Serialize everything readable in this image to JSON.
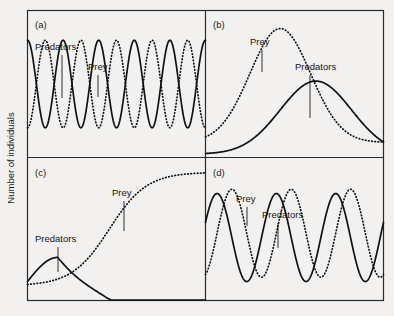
{
  "figure": {
    "axis": {
      "ylabel": "Number of individuals"
    },
    "panels": [
      {
        "letter": "(a)",
        "labels": [
          {
            "text": "Predators",
            "series": "predators"
          },
          {
            "text": "Prey",
            "series": "prey"
          }
        ]
      },
      {
        "letter": "(b)",
        "labels": [
          {
            "text": "Prey",
            "series": "prey"
          },
          {
            "text": "Predators",
            "series": "predators"
          }
        ]
      },
      {
        "letter": "(c)",
        "labels": [
          {
            "text": "Prey",
            "series": "prey"
          },
          {
            "text": "Predators",
            "series": "predators"
          }
        ]
      },
      {
        "letter": "(d)",
        "labels": [
          {
            "text": "Prey",
            "series": "prey"
          },
          {
            "text": "Predators",
            "series": "predators"
          }
        ]
      }
    ]
  },
  "chart_data": [
    {
      "id": "panel-a",
      "type": "line",
      "title": "(a)",
      "xlabel": "",
      "ylabel": "Number of individuals",
      "xlim": [
        0,
        1
      ],
      "ylim": [
        0,
        1
      ],
      "grid": false,
      "legend": "inline-labels",
      "description": "Sustained neutrally-stable oscillations; predators and prey cycle out of phase with constant amplitude.",
      "series": [
        {
          "name": "Predators",
          "style": "solid",
          "form": "cosine",
          "cycles": 5.0,
          "amplitude": 0.3,
          "baseline": 0.5,
          "phase": 0.0,
          "damping": 0.0
        },
        {
          "name": "Prey",
          "style": "dotted",
          "form": "cosine",
          "cycles": 5.0,
          "amplitude": 0.3,
          "baseline": 0.5,
          "phase": 180.0,
          "damping": 0.0
        }
      ]
    },
    {
      "id": "panel-b",
      "type": "line",
      "title": "(b)",
      "xlabel": "",
      "ylabel": "Number of individuals",
      "xlim": [
        0,
        1
      ],
      "ylim": [
        0,
        1
      ],
      "grid": false,
      "legend": "inline-labels",
      "description": "Single boom-and-bust: prey irrupt to a high peak, predators peak later at lower numbers, then both crash.",
      "series": [
        {
          "name": "Prey",
          "style": "dotted",
          "form": "gaussian-pulse",
          "center": 0.42,
          "width": 0.17,
          "peak": 0.88,
          "baseline": 0.1
        },
        {
          "name": "Predators",
          "style": "solid",
          "form": "gaussian-pulse",
          "center": 0.62,
          "width": 0.2,
          "peak": 0.52,
          "baseline": 0.02
        }
      ]
    },
    {
      "id": "panel-c",
      "type": "line",
      "title": "(c)",
      "xlabel": "",
      "ylabel": "Number of individuals",
      "xlim": [
        0,
        1
      ],
      "ylim": [
        0,
        1
      ],
      "grid": false,
      "legend": "inline-labels",
      "description": "Predators go extinct early; prey then grow sigmoidally to a plateau at carrying capacity.",
      "series": [
        {
          "name": "Prey",
          "style": "dotted",
          "form": "logistic",
          "midpoint": 0.46,
          "steepness": 9.5,
          "start": 0.1,
          "plateau": 0.9
        },
        {
          "name": "Predators",
          "style": "solid",
          "form": "rise-and-extinction",
          "peak": 0.3,
          "peak_at": 0.17,
          "start": 0.13,
          "extinction_at": 0.47
        }
      ]
    },
    {
      "id": "panel-d",
      "type": "line",
      "title": "(d)",
      "xlabel": "",
      "ylabel": "Number of individuals",
      "xlim": [
        0,
        1
      ],
      "ylim": [
        0,
        1
      ],
      "grid": false,
      "legend": "inline-labels",
      "description": "Coupled cycles with a quarter-period lag: prey peaks lead predator peaks.",
      "series": [
        {
          "name": "Prey",
          "style": "dotted",
          "form": "cosine",
          "cycles": 3.0,
          "amplitude": 0.31,
          "baseline": 0.47,
          "phase": 200.0,
          "damping": 0.0
        },
        {
          "name": "Predators",
          "style": "solid",
          "form": "cosine",
          "cycles": 3.0,
          "amplitude": 0.31,
          "baseline": 0.44,
          "phase": 290.0,
          "damping": 0.0
        }
      ]
    }
  ],
  "layout": {
    "panel_letters": [
      "(a)",
      "(b)",
      "(c)",
      "(d)"
    ],
    "labels_a": {
      "predators": "Predators",
      "prey": "Prey"
    },
    "labels_b": {
      "prey": "Prey",
      "predators": "Predators"
    },
    "labels_c": {
      "prey": "Prey",
      "predators": "Predators"
    },
    "labels_d": {
      "prey": "Prey",
      "predators": "Predators"
    }
  },
  "colors": {
    "background": "#f2f1ef",
    "ink": "#111111",
    "frame": "#2b2b2b"
  }
}
